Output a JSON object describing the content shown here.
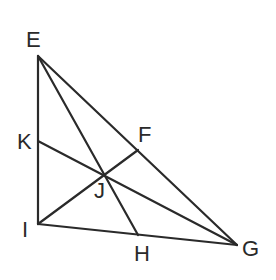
{
  "diagram": {
    "type": "triangle-cevians",
    "stroke_color": "#2a2a2a",
    "points": {
      "E": {
        "x": 38,
        "y": 56
      },
      "I": {
        "x": 38,
        "y": 224
      },
      "G": {
        "x": 237,
        "y": 245
      },
      "K": {
        "x": 38,
        "y": 141
      },
      "F": {
        "x": 138,
        "y": 150
      },
      "H": {
        "x": 138,
        "y": 235
      },
      "J": {
        "x": 105,
        "y": 175
      }
    },
    "segments": [
      [
        "E",
        "I"
      ],
      [
        "I",
        "G"
      ],
      [
        "E",
        "G"
      ],
      [
        "E",
        "H"
      ],
      [
        "K",
        "G"
      ],
      [
        "I",
        "F"
      ]
    ],
    "labels": {
      "E": "E",
      "F": "F",
      "K": "K",
      "J": "J",
      "I": "I",
      "H": "H",
      "G": "G"
    }
  }
}
